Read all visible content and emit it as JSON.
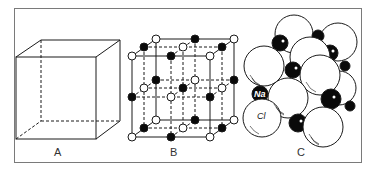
{
  "figure": {
    "panels": [
      {
        "id": "A",
        "label": "A",
        "description": "cube outline (unit cell)"
      },
      {
        "id": "B",
        "label": "B",
        "description": "ball-and-stick lattice with alternating filled and open ions"
      },
      {
        "id": "C",
        "label": "C",
        "description": "space-filling packing model"
      }
    ],
    "atom_labels": {
      "sodium": "Na",
      "chlorine": "Cl"
    }
  },
  "colors": {
    "line": "#1a1a1a",
    "frame": "#7a7a7a",
    "filled_ion": "#0a0a0a",
    "open_ion": "#ffffff",
    "label": "#333333"
  }
}
